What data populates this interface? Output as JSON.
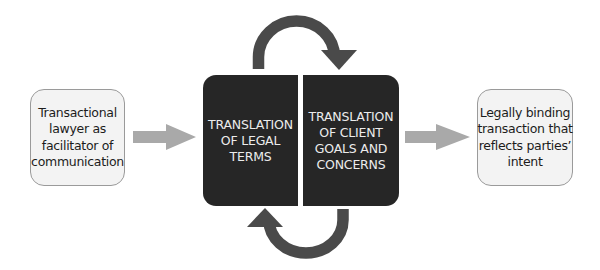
{
  "diagram": {
    "start_node": {
      "lines": [
        "Transactional",
        "lawyer as",
        "facilitator of",
        "communication"
      ]
    },
    "translation_left": {
      "lines": [
        "TRANSLATION",
        "OF LEGAL",
        "TERMS"
      ]
    },
    "translation_right": {
      "lines": [
        "TRANSLATION",
        "OF CLIENT",
        "GOALS AND",
        "CONCERNS"
      ]
    },
    "end_node": {
      "lines": [
        "Legally binding",
        "transaction that",
        "reflects parties’",
        "intent"
      ]
    },
    "arrows": [
      {
        "from": "start_node",
        "to": "translation_block",
        "style": "straight",
        "color": "#a9a9a9"
      },
      {
        "from": "translation_left",
        "to": "translation_right",
        "style": "curved-top",
        "color": "#4a4a4a"
      },
      {
        "from": "translation_right",
        "to": "translation_left",
        "style": "curved-bottom",
        "color": "#4a4a4a"
      },
      {
        "from": "translation_block",
        "to": "end_node",
        "style": "straight",
        "color": "#a9a9a9"
      }
    ],
    "colors": {
      "light_box_fill": "#f3f3f3",
      "light_box_border": "#9a9a9a",
      "dark_box_fill": "#262626",
      "dark_box_text": "#ececec",
      "straight_arrow": "#a9a9a9",
      "cycle_arrow": "#4a4a4a"
    }
  }
}
